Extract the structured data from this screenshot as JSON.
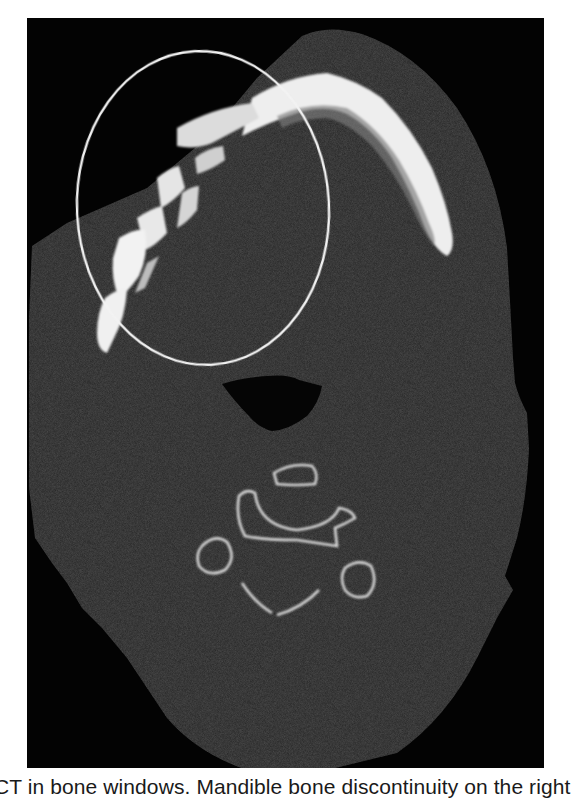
{
  "figure": {
    "modality": "CT axial slice, bone window",
    "annotation": {
      "shape": "ellipse",
      "color": "#f2f2f2",
      "description": "circle marking right mandible discontinuity"
    },
    "structures": [
      "mandible",
      "airway",
      "cervical vertebra (C1/C2)",
      "soft tissue outline"
    ],
    "colors": {
      "background": "#030303",
      "soft_tissue": "#2a2a2a",
      "bone": "#f0f0f0",
      "page": "#ffffff"
    }
  },
  "caption": {
    "text": "CT in bone windows. Mandible bone discontinuity on the right"
  }
}
